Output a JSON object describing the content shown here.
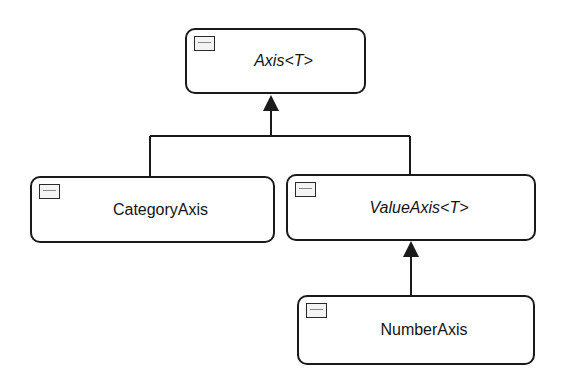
{
  "diagram": {
    "type": "class-hierarchy",
    "colors": {
      "stroke": "#1a1a1a",
      "fill": "#ffffff",
      "icon_fill": "#f4f4f4"
    },
    "nodes": [
      {
        "id": "axis",
        "label": "Axis<T>",
        "abstract": true,
        "icon": "class-icon"
      },
      {
        "id": "category-axis",
        "label": "CategoryAxis",
        "abstract": false,
        "icon": "class-icon"
      },
      {
        "id": "value-axis",
        "label": "ValueAxis<T>",
        "abstract": true,
        "icon": "class-icon"
      },
      {
        "id": "number-axis",
        "label": "NumberAxis",
        "abstract": false,
        "icon": "class-icon"
      }
    ],
    "edges": [
      {
        "from": "CategoryAxis",
        "to": "Axis<T>",
        "type": "inheritance"
      },
      {
        "from": "ValueAxis<T>",
        "to": "Axis<T>",
        "type": "inheritance"
      },
      {
        "from": "NumberAxis",
        "to": "ValueAxis<T>",
        "type": "inheritance"
      }
    ]
  }
}
